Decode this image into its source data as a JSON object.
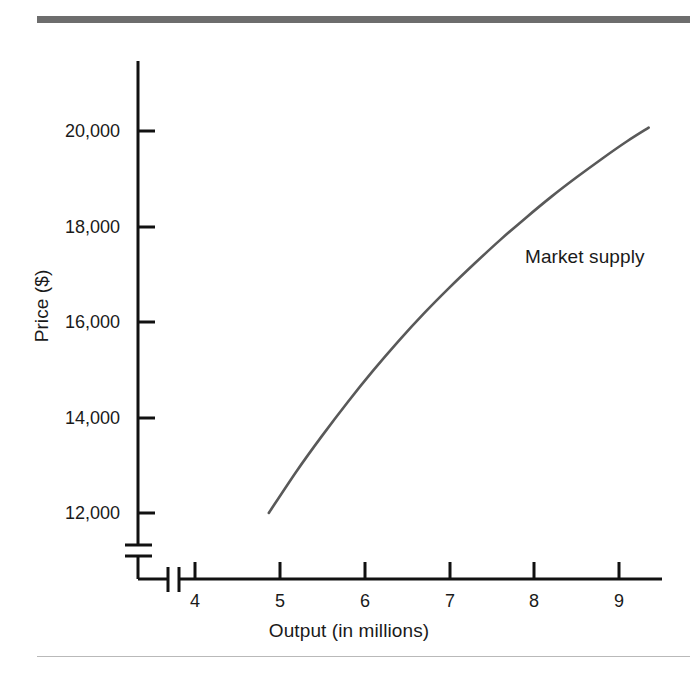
{
  "figure": {
    "title": "",
    "top_rule_color": "#6d6d6d",
    "bottom_rule_color": "#b9b9b9",
    "background": "#ffffff"
  },
  "chart_data": {
    "type": "line",
    "title": "",
    "xlabel": "Output (in millions)",
    "ylabel": "Price ($)",
    "xlim": [
      3.55,
      9.7
    ],
    "ylim": [
      11000,
      21300
    ],
    "grid": false,
    "legend_position": "inline-annotation",
    "axis_break_x": true,
    "axis_break_y": true,
    "xticks": [
      4,
      5,
      6,
      7,
      8,
      9
    ],
    "xtick_labels": [
      "4",
      "5",
      "6",
      "7",
      "8",
      "9"
    ],
    "yticks": [
      12000,
      14000,
      16000,
      18000,
      20000
    ],
    "ytick_labels": [
      "12,000",
      "14,000",
      "16,000",
      "18,000",
      "20,000"
    ],
    "series": [
      {
        "name": "Market supply",
        "color": "#595959",
        "annotation": "Market supply",
        "x": [
          4.87,
          5.2,
          5.5,
          5.8,
          6.1,
          6.4,
          6.7,
          7.0,
          7.3,
          7.6,
          7.9,
          8.2,
          8.5,
          8.8,
          9.1,
          9.35
        ],
        "y": [
          12000,
          12880,
          13620,
          14320,
          14980,
          15600,
          16180,
          16720,
          17230,
          17720,
          18180,
          18620,
          19030,
          19420,
          19790,
          20070
        ]
      }
    ]
  }
}
